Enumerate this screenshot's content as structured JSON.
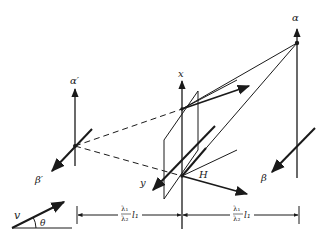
{
  "diagram": {
    "type": "optical-geometry",
    "labels": {
      "alpha_prime": "α′",
      "beta_prime": "β′",
      "x_axis": "x",
      "y_axis": "y",
      "H": "H",
      "alpha": "α",
      "beta": "β",
      "v": "v",
      "theta": "θ"
    },
    "dimensions": {
      "left": {
        "num": "λ₁",
        "den": "λ₂",
        "suffix": "l₁"
      },
      "right": {
        "num": "λ₁",
        "den": "λ₂",
        "suffix": "l₁"
      }
    },
    "colors": {
      "ink": "#1a1a1a",
      "background": "#ffffff"
    }
  }
}
